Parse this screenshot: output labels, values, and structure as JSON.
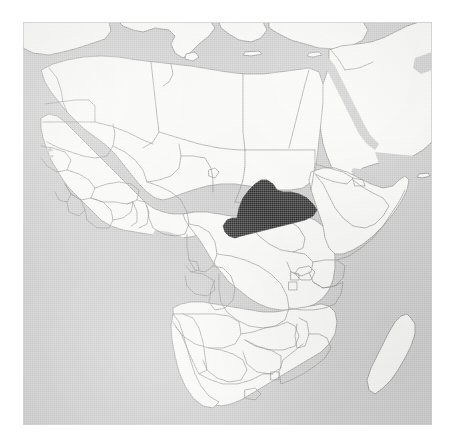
{
  "image": {
    "kind": "locator-map",
    "title": "Location of the Central African Republic in Africa",
    "width": 456,
    "height": 448,
    "background_color": "#ffffff"
  },
  "map": {
    "region_shown": "Africa with parts of Southern Europe, the Middle East and the Arabian Peninsula",
    "projection_note": "Equirectangular-style locator map",
    "frame": {
      "left": 23,
      "top": 22,
      "width": 409,
      "height": 403
    },
    "colors": {
      "ocean": "#c9c9c9",
      "land": "#f7f7f5",
      "highlight": "#2b2b2b",
      "border": "#8a8a8a",
      "coastline": "#7d7d7d",
      "page_background": "#ffffff"
    },
    "style": {
      "texture": "scanned halftone paper grain",
      "border_width_px": 0.7,
      "labels_visible": false,
      "graticule_visible": false,
      "legend_visible": false,
      "scale_bar_visible": false
    },
    "highlighted_country": {
      "name": "Central African Republic",
      "fill": "#2b2b2b",
      "approx_center_px": {
        "x": 249,
        "y": 194
      }
    },
    "water_bodies": [
      "Mediterranean Sea",
      "Atlantic Ocean",
      "Indian Ocean",
      "Red Sea",
      "Gulf of Aden",
      "Persian Gulf",
      "Mozambique Channel",
      "Lake Victoria",
      "Lake Tanganyika",
      "Lake Malawi",
      "Lake Chad"
    ],
    "islands": [
      "Madagascar",
      "Sicily",
      "Crete",
      "Cyprus",
      "Socotra"
    ],
    "countries_visible": [
      "Morocco",
      "Western Sahara",
      "Algeria",
      "Tunisia",
      "Libya",
      "Egypt",
      "Mauritania",
      "Mali",
      "Niger",
      "Chad",
      "Sudan",
      "Eritrea",
      "Djibouti",
      "Ethiopia",
      "Somalia",
      "Senegal",
      "Gambia",
      "Guinea-Bissau",
      "Guinea",
      "Sierra Leone",
      "Liberia",
      "Cote d'Ivoire",
      "Burkina Faso",
      "Ghana",
      "Togo",
      "Benin",
      "Nigeria",
      "Cameroon",
      "Central African Republic",
      "Equatorial Guinea",
      "Gabon",
      "Republic of the Congo",
      "Democratic Republic of the Congo",
      "South Sudan",
      "Uganda",
      "Kenya",
      "Rwanda",
      "Burundi",
      "Tanzania",
      "Angola",
      "Zambia",
      "Malawi",
      "Mozambique",
      "Zimbabwe",
      "Botswana",
      "Namibia",
      "South Africa",
      "Lesotho",
      "Eswatini",
      "Madagascar",
      "Spain",
      "Portugal",
      "Italy",
      "Greece",
      "Turkey",
      "Syria",
      "Lebanon",
      "Israel",
      "Jordan",
      "Iraq",
      "Saudi Arabia",
      "Yemen",
      "Oman",
      "United Arab Emirates",
      "Kuwait",
      "Iran"
    ]
  }
}
